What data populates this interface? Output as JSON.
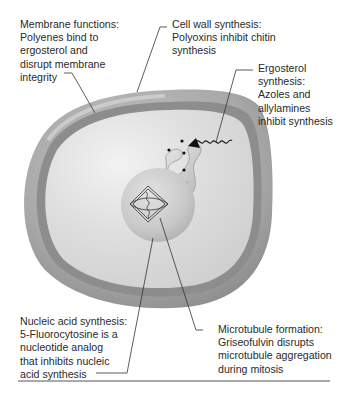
{
  "figure": {
    "structures": {
      "cell_wall": "cell-wall",
      "cell_membrane": "cell-membrane",
      "cytoplasm": "cytoplasm",
      "nucleus": "nucleus",
      "mitotic_spindle": "mitotic-spindle",
      "ergosterol_pathway": "ergosterol-synthesis-structure"
    },
    "colors": {
      "wall_outer": "#a9a9a9",
      "wall_band": "#8f8f8f",
      "cytoplasm": "#d9d9d9",
      "highlight": "#f0f0f0",
      "nucleus": "#c9c9c9",
      "leader_line": "#333333",
      "divider": "#555555"
    }
  },
  "labels": {
    "membrane": {
      "lines": [
        "Membrane functions:",
        "Polyenes bind to",
        "ergosterol and",
        "disrupt membrane",
        "integrity"
      ]
    },
    "cell_wall": {
      "lines": [
        "Cell wall synthesis:",
        "Polyoxins inhibit chitin",
        "synthesis"
      ]
    },
    "ergosterol": {
      "lines": [
        "Ergosterol",
        "synthesis:",
        "Azoles and",
        "allylamines",
        "inhibit synthesis"
      ]
    },
    "nucleic_acid": {
      "lines": [
        "Nucleic acid synthesis:",
        "5-Fluorocytosine is a",
        "nucleotide analog",
        "that inhibits nucleic",
        "acid synthesis"
      ]
    },
    "microtubule": {
      "lines": [
        "Microtubule formation:",
        "Griseofulvin disrupts",
        "microtubule aggregation",
        "during mitosis"
      ]
    }
  }
}
